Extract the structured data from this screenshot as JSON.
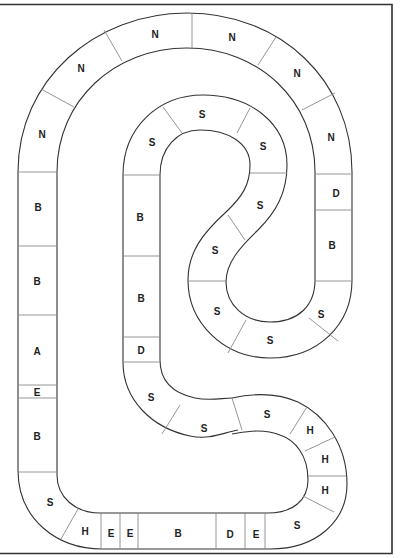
{
  "board": {
    "type": "race-track board game",
    "colors": {
      "line": "#333333",
      "divider": "#8a8a8a",
      "background": "#ffffff",
      "text": "#222222"
    },
    "outer_track": {
      "cells": [
        {
          "label": "N",
          "x": 42,
          "y": 134
        },
        {
          "label": "N",
          "x": 81,
          "y": 68
        },
        {
          "label": "N",
          "x": 155,
          "y": 34
        },
        {
          "label": "N",
          "x": 232,
          "y": 37
        },
        {
          "label": "N",
          "x": 297,
          "y": 73
        },
        {
          "label": "N",
          "x": 331,
          "y": 137
        },
        {
          "label": "D",
          "x": 336,
          "y": 193
        },
        {
          "label": "B",
          "x": 332,
          "y": 245
        },
        {
          "label": "S",
          "x": 321,
          "y": 314
        },
        {
          "label": "S",
          "x": 270,
          "y": 340
        },
        {
          "label": "S",
          "x": 217,
          "y": 311
        },
        {
          "label": "S",
          "x": 215,
          "y": 250
        },
        {
          "label": "S",
          "x": 260,
          "y": 205
        },
        {
          "label": "S",
          "x": 263,
          "y": 146
        },
        {
          "label": "S",
          "x": 202,
          "y": 114
        },
        {
          "label": "S",
          "x": 152,
          "y": 142
        },
        {
          "label": "B",
          "x": 140,
          "y": 217
        },
        {
          "label": "B",
          "x": 141,
          "y": 298
        },
        {
          "label": "D",
          "x": 141,
          "y": 350
        },
        {
          "label": "S",
          "x": 151,
          "y": 397
        },
        {
          "label": "S",
          "x": 204,
          "y": 428
        },
        {
          "label": "S",
          "x": 267,
          "y": 414
        },
        {
          "label": "H",
          "x": 310,
          "y": 430
        },
        {
          "label": "H",
          "x": 325,
          "y": 459
        },
        {
          "label": "H",
          "x": 325,
          "y": 490
        },
        {
          "label": "S",
          "x": 297,
          "y": 525
        },
        {
          "label": "E",
          "x": 256,
          "y": 534
        },
        {
          "label": "D",
          "x": 230,
          "y": 534
        },
        {
          "label": "B",
          "x": 178,
          "y": 533
        },
        {
          "label": "E",
          "x": 130,
          "y": 533
        },
        {
          "label": "E",
          "x": 111,
          "y": 533
        },
        {
          "label": "H",
          "x": 85,
          "y": 531
        },
        {
          "label": "S",
          "x": 50,
          "y": 502
        },
        {
          "label": "B",
          "x": 37,
          "y": 436
        },
        {
          "label": "E",
          "x": 37,
          "y": 392
        },
        {
          "label": "A",
          "x": 37,
          "y": 351
        },
        {
          "label": "B",
          "x": 37,
          "y": 281
        },
        {
          "label": "B",
          "x": 38,
          "y": 207
        }
      ]
    }
  }
}
